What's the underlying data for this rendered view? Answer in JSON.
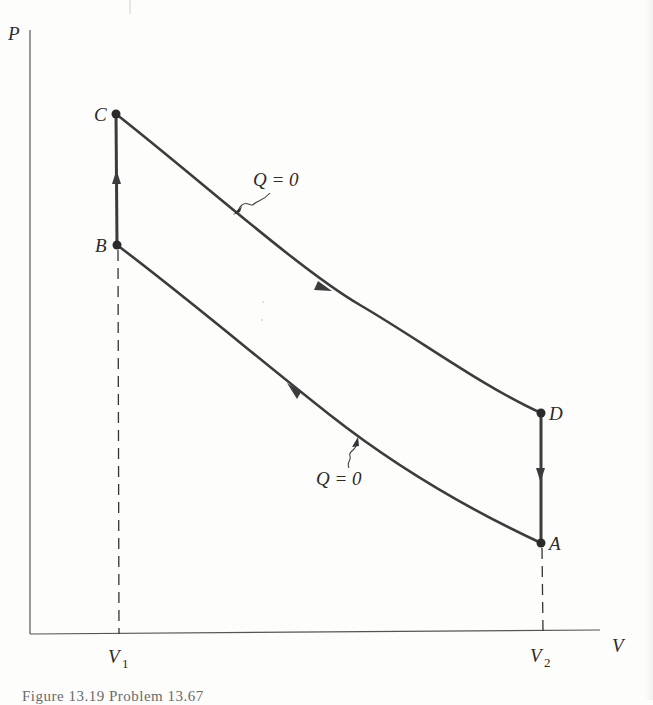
{
  "diagram": {
    "type": "pressure-volume cycle (Otto-like, two adiabats and two isochores)",
    "axes": {
      "y_label": "P",
      "x_label": "V",
      "x_ticks": [
        {
          "main": "V",
          "sub": "1"
        },
        {
          "main": "V",
          "sub": "2"
        }
      ]
    },
    "points": {
      "A": "A",
      "B": "B",
      "C": "C",
      "D": "D"
    },
    "annotations": {
      "upper_curve": "Q = 0",
      "lower_curve": "Q = 0"
    },
    "processes": [
      {
        "from": "A",
        "to": "B",
        "kind": "adiabatic compression",
        "label": "Q = 0"
      },
      {
        "from": "B",
        "to": "C",
        "kind": "isochoric heating at V1"
      },
      {
        "from": "C",
        "to": "D",
        "kind": "adiabatic expansion",
        "label": "Q = 0"
      },
      {
        "from": "D",
        "to": "A",
        "kind": "isochoric cooling at V2"
      }
    ],
    "colors": {
      "curve": "#3c3c3c",
      "axis": "#555555",
      "text": "#2b2b2b"
    }
  },
  "caption": {
    "text": "Figure 13.19   Problem 13.67"
  }
}
